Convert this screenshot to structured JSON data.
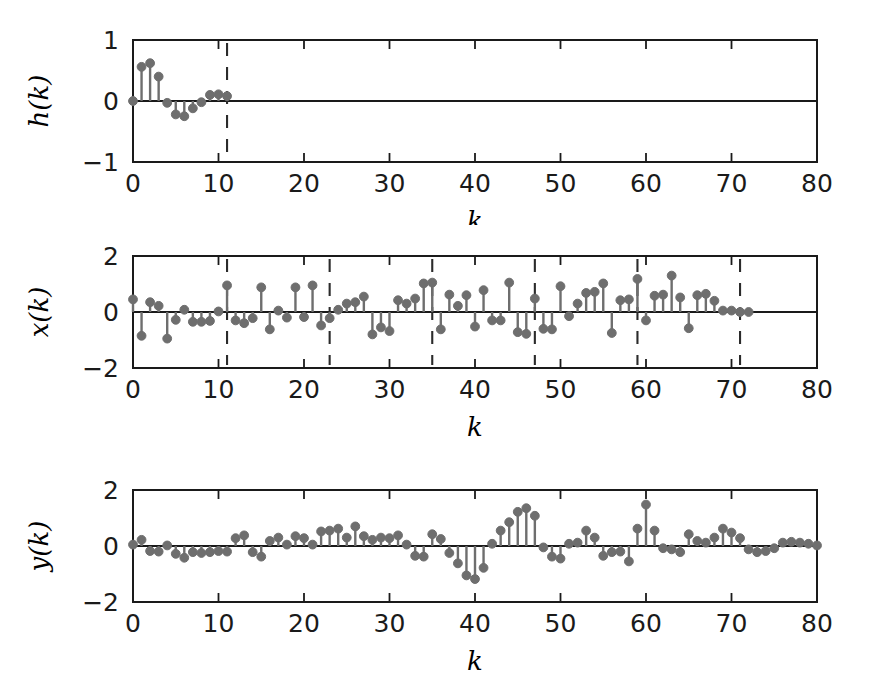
{
  "figure": {
    "background": "#ffffff",
    "stem_color": "#6e6e6e",
    "axis_color": "#1a1a1a",
    "dash_color": "#2b2b2b"
  },
  "chart_data": [
    {
      "type": "line",
      "subtype": "stem",
      "panel": "top",
      "title": "",
      "xlabel": "k",
      "ylabel": "h(k)",
      "xlim": [
        0,
        80
      ],
      "ylim": [
        -1,
        1
      ],
      "xticks": [
        0,
        10,
        20,
        30,
        40,
        50,
        60,
        70,
        80
      ],
      "xticklabels": [
        "0",
        "10",
        "20",
        "30",
        "40",
        "50",
        "60",
        "70",
        "80"
      ],
      "yticks": [
        -1,
        0,
        1
      ],
      "yticklabels": [
        "-1",
        "0",
        "1"
      ],
      "grid": false,
      "legend": null,
      "markers": "filled-circle",
      "annotations": [
        {
          "type": "vline",
          "style": "dashed",
          "x": 11
        }
      ],
      "x": [
        0,
        1,
        2,
        3,
        4,
        5,
        6,
        7,
        8,
        9,
        10,
        11
      ],
      "values": [
        0.0,
        0.56,
        0.62,
        0.4,
        -0.03,
        -0.22,
        -0.25,
        -0.12,
        -0.02,
        0.1,
        0.11,
        0.08
      ]
    },
    {
      "type": "line",
      "subtype": "stem",
      "panel": "middle",
      "title": "",
      "xlabel": "k",
      "ylabel": "x(k)",
      "xlim": [
        0,
        80
      ],
      "ylim": [
        -2,
        2
      ],
      "xticks": [
        0,
        10,
        20,
        30,
        40,
        50,
        60,
        70,
        80
      ],
      "xticklabels": [
        "0",
        "10",
        "20",
        "30",
        "40",
        "50",
        "60",
        "70",
        "80"
      ],
      "yticks": [
        -2,
        0,
        2
      ],
      "yticklabels": [
        "-2",
        "0",
        "2"
      ],
      "grid": false,
      "legend": null,
      "markers": "filled-circle",
      "annotations": [
        {
          "type": "vline",
          "style": "dashed",
          "x": 11
        },
        {
          "type": "vline",
          "style": "dashed",
          "x": 23
        },
        {
          "type": "vline",
          "style": "dashed",
          "x": 35
        },
        {
          "type": "vline",
          "style": "dashed",
          "x": 47
        },
        {
          "type": "vline",
          "style": "dashed",
          "x": 59
        },
        {
          "type": "vline",
          "style": "dashed",
          "x": 71
        }
      ],
      "x": [
        0,
        1,
        2,
        3,
        4,
        5,
        6,
        7,
        8,
        9,
        10,
        11,
        12,
        13,
        14,
        15,
        16,
        17,
        18,
        19,
        20,
        21,
        22,
        23,
        24,
        25,
        26,
        27,
        28,
        29,
        30,
        31,
        32,
        33,
        34,
        35,
        36,
        37,
        38,
        39,
        40,
        41,
        42,
        43,
        44,
        45,
        46,
        47,
        48,
        49,
        50,
        51,
        52,
        53,
        54,
        55,
        56,
        57,
        58,
        59,
        60,
        61,
        62,
        63,
        64,
        65,
        66,
        67,
        68,
        69,
        70,
        71,
        72
      ],
      "values": [
        0.45,
        -0.85,
        0.35,
        0.22,
        -0.95,
        -0.28,
        0.08,
        -0.35,
        -0.35,
        -0.32,
        0.02,
        0.95,
        -0.3,
        -0.4,
        -0.22,
        0.88,
        -0.62,
        0.05,
        -0.2,
        0.88,
        -0.18,
        0.95,
        -0.48,
        -0.22,
        0.08,
        0.3,
        0.35,
        0.55,
        -0.8,
        -0.55,
        -0.68,
        0.42,
        0.3,
        0.48,
        1.02,
        1.05,
        -0.62,
        0.62,
        0.22,
        0.6,
        -0.52,
        0.78,
        -0.3,
        -0.3,
        1.05,
        -0.72,
        -0.78,
        0.48,
        -0.6,
        -0.62,
        0.92,
        -0.15,
        0.3,
        0.68,
        0.72,
        1.02,
        -0.75,
        0.42,
        0.45,
        1.18,
        -0.3,
        0.58,
        0.62,
        1.3,
        0.52,
        -0.58,
        0.6,
        0.65,
        0.4,
        0.05,
        0.05,
        0.0,
        0.0
      ]
    },
    {
      "type": "line",
      "subtype": "stem",
      "panel": "bottom",
      "title": "",
      "xlabel": "k",
      "ylabel": "y(k)",
      "xlim": [
        0,
        80
      ],
      "ylim": [
        -2,
        2
      ],
      "xticks": [
        0,
        10,
        20,
        30,
        40,
        50,
        60,
        70,
        80
      ],
      "xticklabels": [
        "0",
        "10",
        "20",
        "30",
        "40",
        "50",
        "60",
        "70",
        "80"
      ],
      "yticks": [
        -2,
        0,
        2
      ],
      "yticklabels": [
        "-2",
        "0",
        "2"
      ],
      "grid": false,
      "legend": null,
      "markers": "filled-circle",
      "annotations": [],
      "x": [
        0,
        1,
        2,
        3,
        4,
        5,
        6,
        7,
        8,
        9,
        10,
        11,
        12,
        13,
        14,
        15,
        16,
        17,
        18,
        19,
        20,
        21,
        22,
        23,
        24,
        25,
        26,
        27,
        28,
        29,
        30,
        31,
        32,
        33,
        34,
        35,
        36,
        37,
        38,
        39,
        40,
        41,
        42,
        43,
        44,
        45,
        46,
        47,
        48,
        49,
        50,
        51,
        52,
        53,
        54,
        55,
        56,
        57,
        58,
        59,
        60,
        61,
        62,
        63,
        64,
        65,
        66,
        67,
        68,
        69,
        70,
        71,
        72,
        73,
        74,
        75,
        76,
        77,
        78,
        79,
        80
      ],
      "values": [
        0.05,
        0.22,
        -0.18,
        -0.2,
        0.02,
        -0.28,
        -0.42,
        -0.22,
        -0.25,
        -0.22,
        -0.18,
        -0.2,
        0.28,
        0.38,
        -0.22,
        -0.38,
        0.18,
        0.3,
        0.05,
        0.35,
        0.28,
        0.05,
        0.52,
        0.55,
        0.62,
        0.3,
        0.7,
        0.35,
        0.22,
        0.3,
        0.28,
        0.38,
        0.05,
        -0.35,
        -0.38,
        0.42,
        0.25,
        -0.25,
        -0.62,
        -1.05,
        -1.18,
        -0.78,
        0.08,
        0.55,
        0.85,
        1.22,
        1.35,
        1.08,
        -0.05,
        -0.38,
        -0.45,
        0.08,
        0.12,
        0.55,
        0.3,
        -0.35,
        -0.22,
        -0.2,
        -0.55,
        0.62,
        1.48,
        0.55,
        -0.08,
        -0.12,
        -0.22,
        0.42,
        0.18,
        0.12,
        0.3,
        0.62,
        0.48,
        0.28,
        -0.12,
        -0.22,
        -0.18,
        -0.08,
        0.12,
        0.15,
        0.12,
        0.08,
        0.02
      ]
    }
  ],
  "panels": [
    {
      "id": "h",
      "ylabel": "h(k)",
      "xlabel": "k",
      "ytick_labels": [
        "1",
        "0",
        "-1"
      ],
      "xtick_labels": [
        "0",
        "10",
        "20",
        "30",
        "40",
        "50",
        "60",
        "70",
        "80"
      ]
    },
    {
      "id": "x",
      "ylabel": "x(k)",
      "xlabel": "k",
      "ytick_labels": [
        "2",
        "0",
        "-2"
      ],
      "xtick_labels": [
        "0",
        "10",
        "20",
        "30",
        "40",
        "50",
        "60",
        "70",
        "80"
      ]
    },
    {
      "id": "y",
      "ylabel": "y(k)",
      "xlabel": "k",
      "ytick_labels": [
        "2",
        "0",
        "-2"
      ],
      "xtick_labels": [
        "0",
        "10",
        "20",
        "30",
        "40",
        "50",
        "60",
        "70",
        "80"
      ]
    }
  ]
}
